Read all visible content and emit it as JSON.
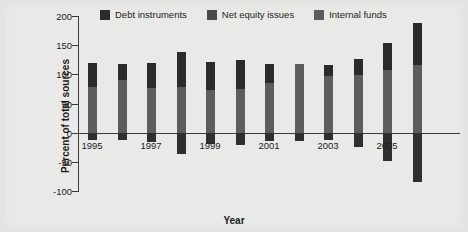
{
  "chart_data": {
    "type": "bar",
    "title": "",
    "subtitle": "",
    "xlabel": "Year",
    "ylabel": "Percent of total sources",
    "stacked": true,
    "grid": false,
    "legend_position": "top",
    "ylim": [
      -100,
      200
    ],
    "yticks": [
      200,
      150,
      100,
      50,
      0,
      -50,
      -100
    ],
    "ytick_labels": [
      "200",
      "150",
      "100",
      "50",
      "0",
      "-50",
      "-100"
    ],
    "xlim": [
      1994.5,
      2006.5
    ],
    "categories": [
      1995,
      1996,
      1997,
      1998,
      1999,
      2000,
      2001,
      2002,
      2003,
      2004,
      2005,
      2006
    ],
    "xtick_labels": [
      "1995",
      "1997",
      "1999",
      "2001",
      "2003",
      "2005"
    ],
    "xtick_label_years": [
      1995,
      1997,
      1999,
      2001,
      2003,
      2005
    ],
    "series": [
      {
        "name": "Internal funds",
        "color": "#5d5d5d",
        "values": [
          79,
          90,
          77,
          79,
          74,
          75,
          85,
          118,
          98,
          99,
          108,
          116
        ]
      },
      {
        "name": "Debt instruments",
        "color": "#2b2b2b",
        "values": [
          40,
          27,
          43,
          60,
          48,
          49,
          32,
          0,
          18,
          27,
          45,
          72
        ]
      },
      {
        "name": "Net equity issues",
        "color": "#2f2f2f",
        "values": [
          -13,
          -13,
          -16,
          -36,
          -20,
          -21,
          -14,
          -14,
          -13,
          -24,
          -49,
          -85
        ]
      }
    ],
    "stack_tops": [
      119,
      117,
      120,
      139,
      122,
      124,
      117,
      118,
      116,
      126,
      153,
      188
    ],
    "units": "percent"
  },
  "legend": {
    "items": [
      {
        "label": "Debt instruments",
        "color": "#2b2b2b"
      },
      {
        "label": "Net equity issues",
        "color": "#4a4a4a"
      },
      {
        "label": "Internal funds",
        "color": "#5d5d5d"
      }
    ]
  },
  "axes": {
    "y_title": "Percent of total sources",
    "x_title": "Year"
  }
}
